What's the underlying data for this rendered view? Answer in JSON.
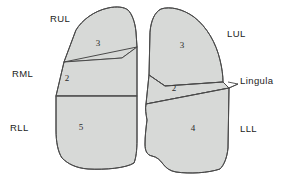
{
  "diagram": {
    "colors": {
      "lobe_fill": "#d7d9d7",
      "outline": "#4a4a4a",
      "background": "#ffffff",
      "text": "#1c1c1c"
    },
    "right_lung": {
      "name": "Right lung",
      "labels": {
        "upper_lobe": "RUL",
        "middle_lobe": "RML",
        "lower_lobe": "RLL"
      },
      "segment_numbers": {
        "upper_lobe": "3",
        "middle_lobe": "2",
        "lower_lobe": "5"
      }
    },
    "left_lung": {
      "name": "Left lung",
      "labels": {
        "upper_lobe": "LUL",
        "lingula": "Lingula",
        "lower_lobe": "LLL"
      },
      "segment_numbers": {
        "upper_lobe": "3",
        "lingula": "2",
        "lower_lobe": "4"
      }
    }
  }
}
